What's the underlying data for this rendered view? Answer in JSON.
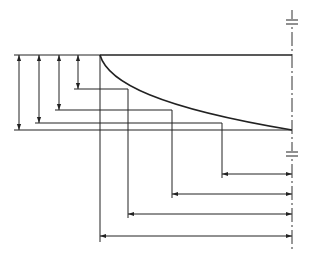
{
  "diagram": {
    "title": "",
    "type": "technical-dimension-drawing",
    "colors": {
      "line": "#222222",
      "centerline": "#333333",
      "background": "#ffffff"
    },
    "profile": {
      "top_edge": {
        "x1": 100,
        "y1": 55,
        "x2": 292,
        "y2": 55
      },
      "curve": {
        "start": [
          100,
          55
        ],
        "end": [
          292,
          130
        ],
        "description": "concave decay curve"
      },
      "left_edge_x": 100
    },
    "centerline": {
      "x": 292,
      "y_top": 10,
      "y_bottom": 250,
      "break_marks_y": [
        22,
        154
      ]
    },
    "vertical_dimensions": [
      {
        "x": 78,
        "y_top": 55,
        "y_bottom": 89
      },
      {
        "x": 59,
        "y_top": 55,
        "y_bottom": 110
      },
      {
        "x": 39,
        "y_top": 55,
        "y_bottom": 123
      },
      {
        "x": 19,
        "y_top": 55,
        "y_bottom": 130
      }
    ],
    "extension_lines_horizontal": [
      {
        "y": 55,
        "x1": 14,
        "x2": 100
      },
      {
        "y": 89,
        "x1": 74,
        "x2": 128
      },
      {
        "y": 110,
        "x1": 55,
        "x2": 172
      },
      {
        "y": 123,
        "x1": 35,
        "x2": 222
      },
      {
        "y": 130,
        "x1": 14,
        "x2": 292
      }
    ],
    "extension_lines_vertical": [
      {
        "x": 128,
        "y1": 89,
        "y2": 218
      },
      {
        "x": 172,
        "y1": 110,
        "y2": 198
      },
      {
        "x": 222,
        "y1": 123,
        "y2": 178
      },
      {
        "x": 100,
        "y1": 55,
        "y2": 242
      }
    ],
    "horizontal_dimensions": [
      {
        "y": 174,
        "x_left": 222,
        "x_right": 292
      },
      {
        "y": 194,
        "x_left": 172,
        "x_right": 292
      },
      {
        "y": 214,
        "x_left": 128,
        "x_right": 292
      },
      {
        "y": 236,
        "x_left": 100,
        "x_right": 292
      }
    ]
  }
}
